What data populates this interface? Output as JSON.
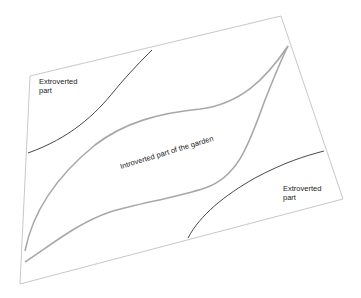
{
  "diagram": {
    "type": "garden zoning sketch",
    "colors": {
      "background": "#ffffff",
      "border": "#c8c8c8",
      "introverted_outline": "#a8a8a8",
      "extroverted_line": "#333333",
      "text": "#1a1a1a"
    },
    "zones": {
      "extroverted_top_left": {
        "label_line1": "Extroverted",
        "label_line2": "part"
      },
      "introverted_center": {
        "label": "Introverted part of the garden"
      },
      "extroverted_bottom_right": {
        "label_line1": "Extroverted",
        "label_line2": "part"
      }
    }
  }
}
